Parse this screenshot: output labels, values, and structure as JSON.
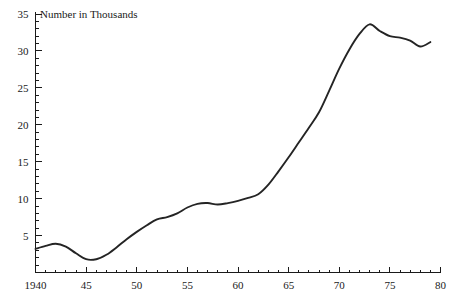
{
  "chart_data": {
    "type": "line",
    "title": "Number in Thousands",
    "xlabel": "",
    "ylabel": "",
    "xlim": [
      1940,
      1980
    ],
    "ylim": [
      0,
      35
    ],
    "grid": false,
    "legend": null,
    "y_ticks": [
      0,
      5,
      10,
      15,
      20,
      25,
      30,
      35
    ],
    "y_tick_labels": [
      "",
      "5",
      "10",
      "15",
      "20",
      "25",
      "30",
      "35"
    ],
    "y_minor_tick_step": 1,
    "x_ticks": [
      1940,
      1945,
      1950,
      1955,
      1960,
      1965,
      1970,
      1975,
      1980
    ],
    "x_tick_labels": [
      "1940",
      "45",
      "50",
      "55",
      "60",
      "65",
      "70",
      "75",
      "80"
    ],
    "x_minor_tick_step": 1,
    "series": [
      {
        "name": "Number in Thousands",
        "color": "#242424",
        "x": [
          1940,
          1941,
          1942,
          1943,
          1944,
          1945,
          1946,
          1947,
          1948,
          1949,
          1950,
          1951,
          1952,
          1953,
          1954,
          1955,
          1956,
          1957,
          1958,
          1959,
          1960,
          1961,
          1962,
          1963,
          1964,
          1965,
          1966,
          1967,
          1968,
          1969,
          1970,
          1971,
          1972,
          1973,
          1974,
          1975,
          1976,
          1977,
          1978,
          1979
        ],
        "values": [
          3.2,
          3.6,
          3.9,
          3.5,
          2.6,
          1.8,
          1.8,
          2.4,
          3.4,
          4.5,
          5.5,
          6.4,
          7.2,
          7.5,
          8.0,
          8.8,
          9.3,
          9.4,
          9.2,
          9.4,
          9.7,
          10.1,
          10.6,
          11.9,
          13.7,
          15.6,
          17.6,
          19.6,
          21.7,
          24.6,
          27.6,
          30.2,
          32.3,
          33.6,
          32.7,
          32.0,
          31.8,
          31.4,
          30.6,
          31.2
        ]
      }
    ]
  },
  "axes": {
    "title_position": "top-left-inside"
  }
}
